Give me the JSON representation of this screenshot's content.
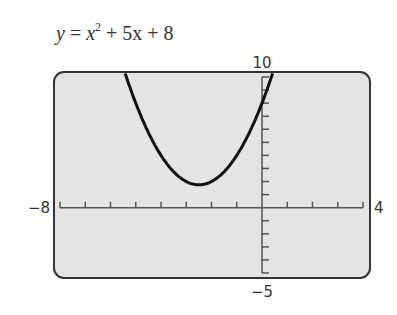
{
  "equation": {
    "lhs": "y",
    "eq": " = ",
    "x": "x",
    "exp": "2",
    "rest": " + 5x + 8"
  },
  "window": {
    "xmin_label": "−8",
    "xmax_label": "4",
    "ymax_label": "10",
    "ymin_label": "−5"
  },
  "colors": {
    "background": "#e4e4e4",
    "border": "#333333",
    "curve": "#111111",
    "axis": "#555555"
  },
  "chart_data": {
    "type": "line",
    "xlabel": "",
    "ylabel": "",
    "xlim": [
      -8,
      4
    ],
    "ylim": [
      -5,
      10
    ],
    "xscale": 1,
    "yscale": 1,
    "grid": false,
    "legend": "none",
    "series": [
      {
        "name": "y = x^2 + 5x + 8",
        "x": [
          -5.4,
          -5,
          -4.5,
          -4,
          -3.5,
          -3,
          -2.5,
          -2,
          -1.5,
          -1,
          -0.5,
          0,
          0.4
        ],
        "values": [
          10.16,
          8,
          6.75,
          4,
          4.75,
          2,
          1.75,
          2,
          2.75,
          4,
          5.75,
          8,
          10.16
        ]
      }
    ],
    "vertex": [
      -2.5,
      1.75
    ],
    "tick_labels": {
      "x": [
        "−8",
        "4"
      ],
      "y": [
        "10",
        "−5"
      ]
    }
  }
}
